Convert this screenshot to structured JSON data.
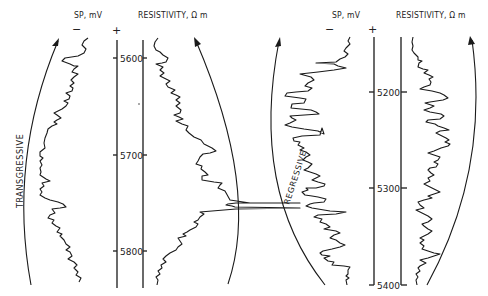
{
  "left_panel": {
    "sp_label": "SP, mV",
    "sp_minus": "−",
    "sp_plus": "+",
    "resistivity_label": "RESISTIVITY, Ω m",
    "trend_label": "TRANSGRESSIVE",
    "depths": [
      "5600",
      "5700",
      "5800"
    ]
  },
  "right_panel": {
    "sp_label": "SP, mV",
    "sp_minus": "−",
    "sp_plus": "+",
    "resistivity_label": "RESISTIVITY, Ω m",
    "trend_label": "REGRESSIVE",
    "depths": [
      "5200",
      "5300",
      "5400"
    ]
  },
  "colors": {
    "ink": "#1a1a1a",
    "background": "#ffffff"
  }
}
